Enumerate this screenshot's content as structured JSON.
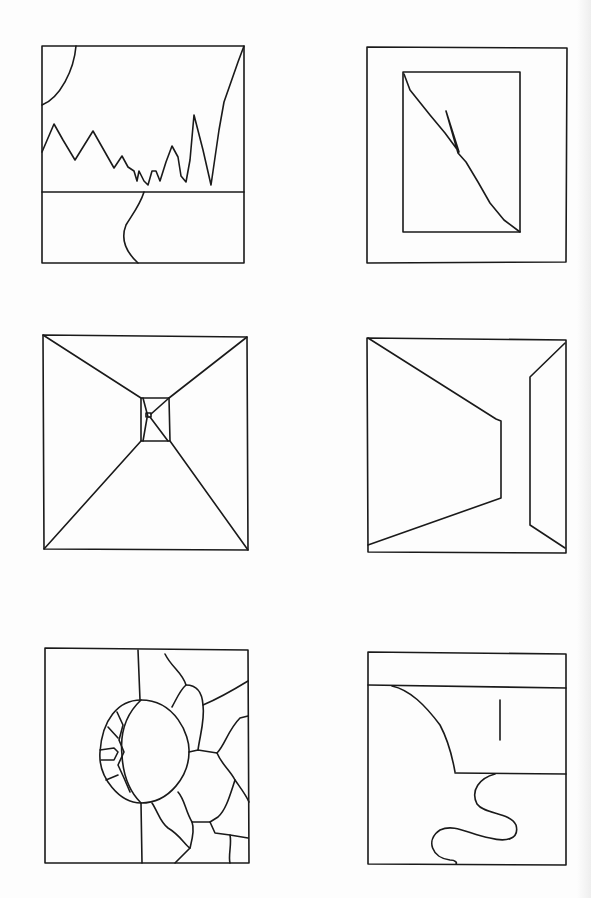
{
  "page": {
    "background_color": "#fdfdfd",
    "stroke_color": "#1a1a1a"
  },
  "panels": [
    {
      "id": 1,
      "label": "Mountain landscape with sun and winding road"
    },
    {
      "id": 2,
      "label": "Framed rectangle with diagonal lightning-like line"
    },
    {
      "id": 3,
      "label": "One-point perspective tunnel / corridor"
    },
    {
      "id": 4,
      "label": "Perspective room with walls and an opening"
    },
    {
      "id": 5,
      "label": "Sphere against a cracked stone wall"
    },
    {
      "id": 6,
      "label": "Cliff edge with winding river and post"
    }
  ]
}
